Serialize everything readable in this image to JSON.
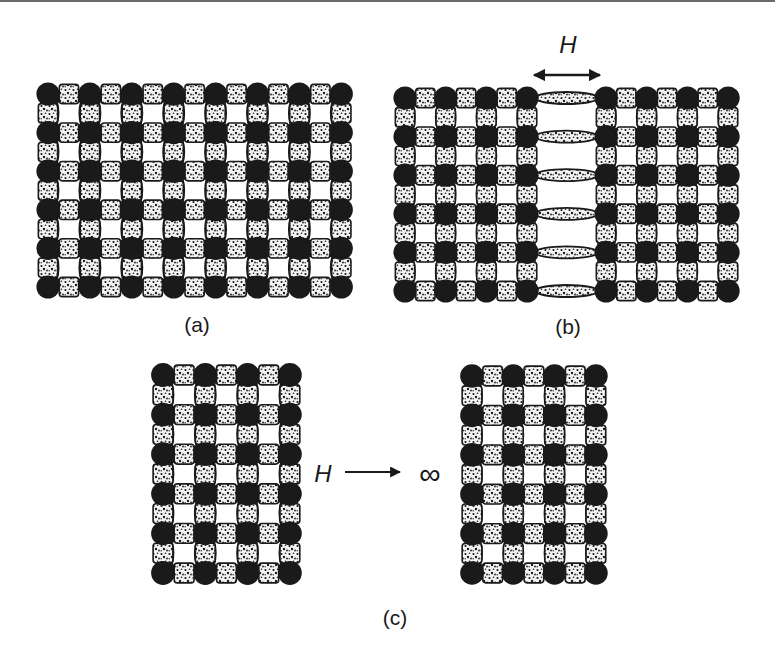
{
  "figure": {
    "colors": {
      "ink": "#1a1a1a",
      "paper": "#ffffff",
      "speckle_bg": "#f4f4f4",
      "topline": "#6a6a6a"
    },
    "panels": [
      {
        "id": "a",
        "label": "(a)",
        "label_pos": [
          197,
          325
        ],
        "blocks": [
          {
            "x0": 48,
            "y0": 94,
            "cols": 8,
            "rows": 6,
            "dx": 41.9,
            "dy": 38.6
          }
        ],
        "bridges": []
      },
      {
        "id": "b",
        "label": "(b)",
        "label_pos": [
          568,
          327
        ],
        "blocks": [
          {
            "x0": 405,
            "y0": 98,
            "cols": 4,
            "rows": 6,
            "dx": 40.7,
            "dy": 38.6
          },
          {
            "x0": 606,
            "y0": 98,
            "cols": 4,
            "rows": 6,
            "dx": 40.7,
            "dy": 38.6
          }
        ],
        "bridges": [
          {
            "x1": 527,
            "x2": 606,
            "y0": 98,
            "rows": 6,
            "dy": 38.6,
            "ry": 6
          }
        ],
        "separation_symbol": "H",
        "separation_label_pos": [
          568,
          45
        ],
        "arrow": {
          "x1": 528,
          "x2": 606,
          "y": 75,
          "type": "double"
        }
      },
      {
        "id": "c",
        "label": "(c)",
        "label_pos": [
          395,
          618
        ],
        "blocks": [
          {
            "x0": 163,
            "y0": 375,
            "cols": 4,
            "rows": 6,
            "dx": 42.3,
            "dy": 39.6
          },
          {
            "x0": 472,
            "y0": 376,
            "cols": 4,
            "rows": 6,
            "dx": 41.3,
            "dy": 39.4
          }
        ],
        "bridges": [],
        "limit": {
          "symbol": "H",
          "symbol_pos": [
            323,
            474
          ],
          "arrow": {
            "x1": 345,
            "x2": 404,
            "y": 472,
            "type": "single"
          },
          "target": "∞",
          "target_pos": [
            430,
            474
          ]
        }
      }
    ],
    "legend_semantics": {
      "dark_circle": "lattice-site",
      "speckled_square": "bond",
      "white_concave_square": "plaquette"
    }
  }
}
